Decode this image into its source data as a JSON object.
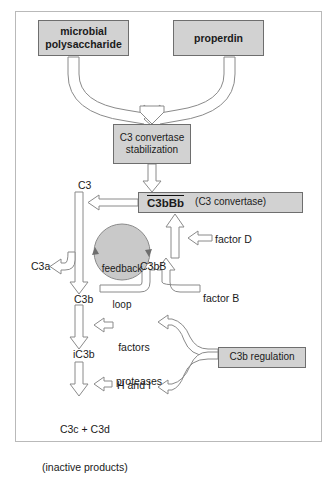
{
  "diagram": {
    "type": "flow-diagram",
    "palette": {
      "box_fill": "#d2d2d2",
      "box_border": "#6e6e6e",
      "arrow_fill": "#ffffff",
      "arrow_stroke": "#8a8a8a",
      "frame_border": "#b9b9b9",
      "text": "#1a1a1a"
    },
    "boxes": [
      {
        "id": "microbial",
        "label": "microbial\npolysaccharide",
        "bold": true
      },
      {
        "id": "properdin",
        "label": "properdin",
        "bold": true
      },
      {
        "id": "stabilization",
        "label": "C3 convertase\nstabilization",
        "bold": false
      },
      {
        "id": "c3bbb_name",
        "label": "C3bBb",
        "bold": true,
        "overline": true
      },
      {
        "id": "c3bbb_alias",
        "label": "(C3 convertase)",
        "bold": false
      },
      {
        "id": "regulation",
        "label": "C3b regulation",
        "bold": false
      }
    ],
    "labels": {
      "c3": "C3",
      "c3a": "C3a",
      "c3b": "C3b",
      "c3bB": "C3bB",
      "ic3b": "iC3b",
      "factor_d": "factor D",
      "factor_b": "factor B",
      "factors_h_i_line1": "factors",
      "factors_h_i_line2": "H and I",
      "proteases": "proteases",
      "feedback_line1": "feedback",
      "feedback_line2": "loop",
      "products_line1": "C3c + C3d",
      "products_line2": "(inactive products)"
    },
    "flows": [
      {
        "from": "microbial",
        "to": "stabilization",
        "style": "curved-merge-arrow"
      },
      {
        "from": "properdin",
        "to": "stabilization",
        "style": "curved-merge-arrow"
      },
      {
        "from": "stabilization",
        "to": "c3bbb",
        "style": "straight-down-arrow"
      },
      {
        "from": "c3bbb",
        "to": "c3",
        "style": "straight-left-arrow"
      },
      {
        "from": "c3",
        "to": "c3b",
        "style": "straight-down-arrow"
      },
      {
        "from": "c3",
        "to": "c3a",
        "style": "branch-left-arrow"
      },
      {
        "from": "c3b",
        "to": "c3bB",
        "style": "curved-up-arrow"
      },
      {
        "from": "factor_b",
        "to": "c3bB",
        "style": "curved-up-arrow"
      },
      {
        "from": "c3bB",
        "to": "c3bbb",
        "style": "straight-up-arrow"
      },
      {
        "from": "factor_d",
        "to": "c3bB-shaft",
        "style": "straight-left-arrow"
      },
      {
        "from": "c3b",
        "to": "ic3b",
        "style": "straight-down-arrow"
      },
      {
        "from": "factors_h_i",
        "to": "c3b-shaft",
        "style": "short-left-arrow"
      },
      {
        "from": "regulation",
        "to": "factors_h_i",
        "style": "curved-left-arrow"
      },
      {
        "from": "regulation",
        "to": "proteases",
        "style": "curved-left-arrow"
      },
      {
        "from": "proteases",
        "to": "ic3b-shaft",
        "style": "short-left-arrow"
      },
      {
        "from": "ic3b",
        "to": "products",
        "style": "straight-down-arrow"
      },
      {
        "from": "feedback_loop",
        "to": "feedback_loop",
        "style": "circular-loop"
      }
    ]
  }
}
